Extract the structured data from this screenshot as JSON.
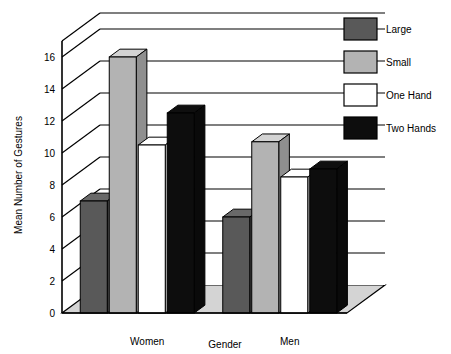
{
  "chart_data": {
    "type": "bar",
    "title": "",
    "subtitle": "",
    "xlabel": "Gender",
    "ylabel": "Mean Number of Gestures",
    "categories": [
      "Women",
      "Men"
    ],
    "series": [
      {
        "name": "Large",
        "values": [
          7.0,
          6.0
        ],
        "color": "#595959"
      },
      {
        "name": "Small",
        "values": [
          16.0,
          10.7
        ],
        "color": "#b3b3b3"
      },
      {
        "name": "One Hand",
        "values": [
          10.5,
          8.5
        ],
        "color": "#ffffff"
      },
      {
        "name": "Two Hands",
        "values": [
          12.5,
          9.0
        ],
        "color": "#0d0d0d"
      }
    ],
    "ylim": [
      0,
      17
    ],
    "yticks": [
      0,
      2,
      4,
      6,
      8,
      10,
      12,
      14,
      16
    ],
    "ytick_labels": [
      "0",
      "2",
      "4",
      "6",
      "8",
      "10",
      "12",
      "14",
      "16"
    ],
    "grid": true,
    "grid_axis": "y",
    "legend_position": "upper right",
    "threed": true,
    "style": {
      "floor_color": "#d4d4d4",
      "wall_color": "#ffffff",
      "line_color": "#000000",
      "background": "#ffffff"
    }
  },
  "legend": {
    "entries": [
      {
        "label": "Large",
        "swatch": "#595959"
      },
      {
        "label": "Small",
        "swatch": "#b3b3b3"
      },
      {
        "label": "One Hand",
        "swatch": "#ffffff"
      },
      {
        "label": "Two Hands",
        "swatch": "#0d0d0d"
      }
    ]
  },
  "axes": {
    "y_title": "Mean Number of Gestures",
    "x_title": "Gender",
    "y_ticks": [
      "16",
      "14",
      "12",
      "10",
      "8",
      "6",
      "4",
      "2",
      "0"
    ],
    "x_ticks": [
      "Women",
      "Men"
    ]
  }
}
